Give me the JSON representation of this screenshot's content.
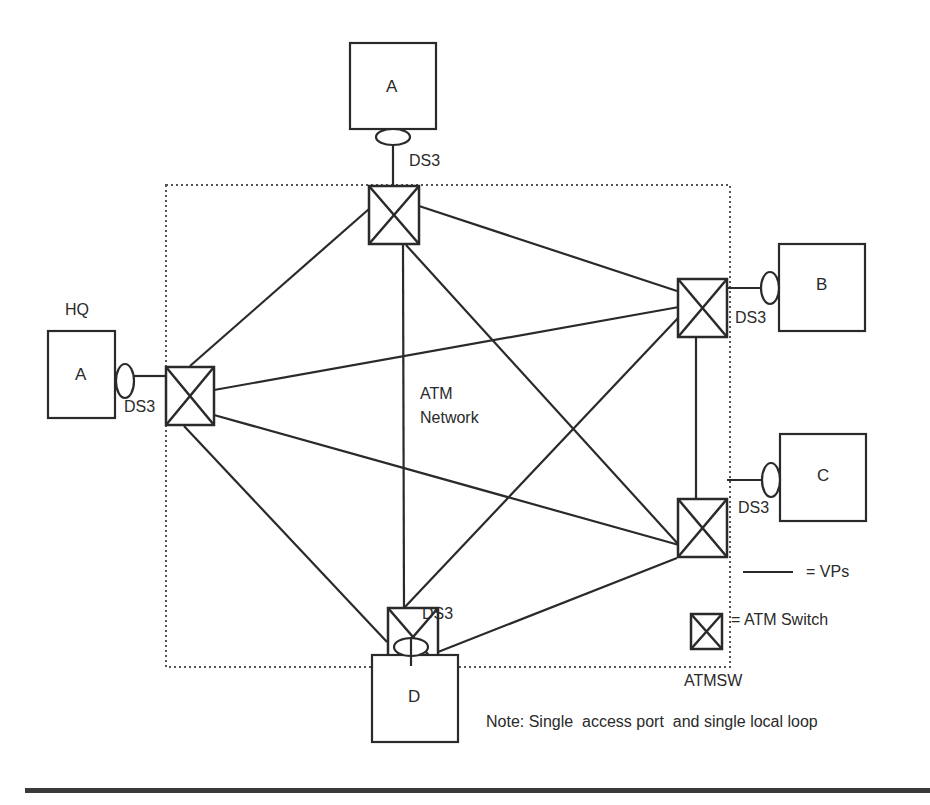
{
  "diagram": {
    "title_note": "Note: Single  access port  and single local loop",
    "network_label_line1": "ATM",
    "network_label_line2": "Network",
    "hq_label": "HQ",
    "sites": [
      {
        "id": "top",
        "label": "A",
        "link_label": "DS3"
      },
      {
        "id": "hq",
        "label": "A",
        "link_label": "DS3"
      },
      {
        "id": "b",
        "label": "B",
        "link_label": "DS3"
      },
      {
        "id": "c",
        "label": "C",
        "link_label": "DS3"
      },
      {
        "id": "d",
        "label": "D",
        "link_label": "DS3"
      }
    ],
    "switches": [
      "top",
      "left",
      "right-top",
      "right-bottom",
      "bottom"
    ],
    "vp_links": [
      [
        "top",
        "left"
      ],
      [
        "top",
        "right-top"
      ],
      [
        "top",
        "bottom"
      ],
      [
        "top",
        "right-bottom"
      ],
      [
        "left",
        "right-top"
      ],
      [
        "left",
        "right-bottom"
      ],
      [
        "left",
        "bottom"
      ],
      [
        "bottom",
        "right-top"
      ],
      [
        "bottom",
        "right-bottom"
      ],
      [
        "right-top",
        "right-bottom"
      ]
    ],
    "legend": {
      "vp_label": "= VPs",
      "switch_label": "= ATM Switch",
      "switch_abbrev": "ATMSW"
    },
    "colors": {
      "stroke": "#2a2a2a",
      "background": "#ffffff"
    }
  }
}
